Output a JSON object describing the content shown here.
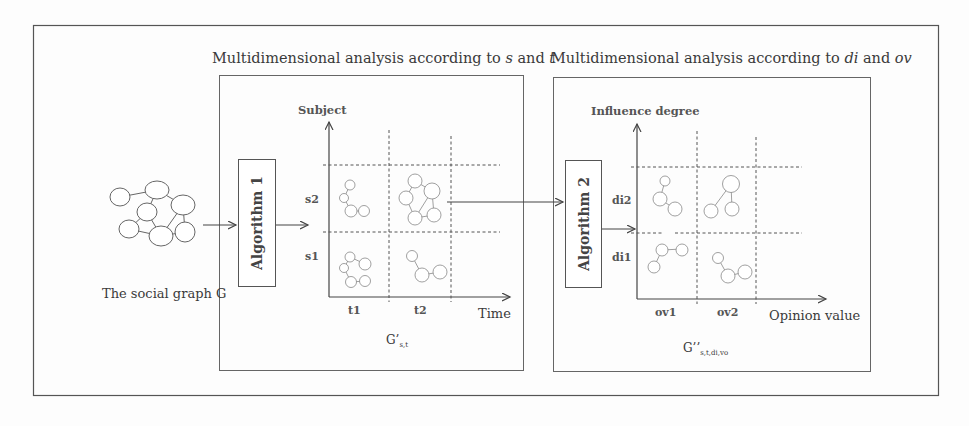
{
  "diagram": {
    "source_graph": {
      "label": "The social graph G"
    },
    "algorithm_1": {
      "label": "Algorithm 1"
    },
    "algorithm_2": {
      "label": "Algorithm 2"
    },
    "panel_st": {
      "title_prefix": "Multidimensional analysis  according to ",
      "title_var1": "s",
      "title_and": " and ",
      "title_var2": "t",
      "y_axis": "Subject",
      "x_axis": "Time",
      "y_ticks": [
        "s2",
        "s1"
      ],
      "x_ticks": [
        "t1",
        "t2"
      ],
      "caption_main": "G’",
      "caption_sub": "s,t"
    },
    "panel_diov": {
      "title_prefix": "Multidimensional analysis according to ",
      "title_var1": "di",
      "title_and": " and ",
      "title_var2": "ov",
      "y_axis": "Influence degree",
      "x_axis": "Opinion value",
      "y_ticks": [
        "di2",
        "di1"
      ],
      "x_ticks": [
        "ov1",
        "ov2"
      ],
      "caption_main": "G’’",
      "caption_sub": "s,t,di,vo"
    },
    "flow": [
      "The social graph G",
      "Algorithm 1",
      "G’s,t",
      "Algorithm 2",
      "G’’s,t,di,vo"
    ],
    "colors": {
      "line": "#555555",
      "node": "#777777",
      "background": "#fdfdfd"
    }
  }
}
